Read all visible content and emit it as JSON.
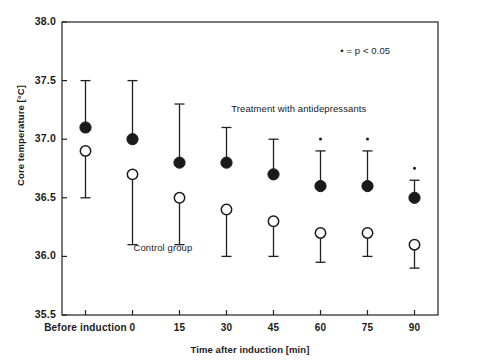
{
  "chart_data": {
    "type": "scatter",
    "title": "",
    "xlabel": "Time after induction [min]",
    "ylabel": "Core temperature [°C]",
    "categories": [
      "Before induction",
      "0",
      "15",
      "30",
      "45",
      "60",
      "75",
      "90"
    ],
    "ylim": [
      35.5,
      38.0
    ],
    "yticks": [
      "35.5",
      "36.0",
      "36.5",
      "37.0",
      "37.5",
      "38.0"
    ],
    "ytick_values": [
      35.5,
      36.0,
      36.5,
      37.0,
      37.5,
      38.0
    ],
    "grid": false,
    "legend_position": "inline-annotations",
    "series": [
      {
        "name": "Treatment with antidepressants",
        "marker": "filled-circle",
        "values": [
          37.1,
          37.0,
          36.8,
          36.8,
          36.7,
          36.6,
          36.6,
          36.5
        ],
        "error_upper": [
          37.5,
          37.5,
          37.3,
          37.1,
          37.0,
          36.9,
          36.9,
          36.65
        ],
        "significance": [
          false,
          false,
          false,
          false,
          false,
          true,
          true,
          true
        ]
      },
      {
        "name": "Control group",
        "marker": "open-circle",
        "values": [
          36.9,
          36.7,
          36.5,
          36.4,
          36.3,
          36.2,
          36.2,
          36.1
        ],
        "error_lower": [
          36.5,
          36.1,
          36.1,
          36.0,
          36.0,
          35.95,
          36.0,
          35.9
        ],
        "significance": [
          false,
          false,
          false,
          false,
          false,
          false,
          false,
          false
        ]
      }
    ],
    "annotations": [
      {
        "name": "significance-legend",
        "text": "• = p < 0.05",
        "x": 0.74,
        "y": 37.74
      },
      {
        "name": "treatment-label",
        "text": "Treatment with antidepressants",
        "x": 0.45,
        "y": 37.25
      },
      {
        "name": "control-label",
        "text": "Control group",
        "x": 0.19,
        "y": 36.06
      }
    ]
  },
  "style": {
    "axis_color": "#231f20",
    "marker_fill": "#1a1a1a",
    "marker_open_fill": "#ffffff",
    "text_color": "#1a1a1a",
    "background": "#ffffff"
  }
}
